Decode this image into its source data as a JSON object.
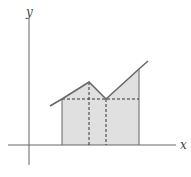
{
  "diagram": {
    "axes": {
      "x_label": "x",
      "y_label": "y"
    },
    "colors": {
      "axis": "#666666",
      "curve": "#666666",
      "fill": "#e0e0e0",
      "dashed": "#333333"
    },
    "curve_points": [
      [
        50,
        106
      ],
      [
        62,
        99
      ],
      [
        89,
        82
      ],
      [
        106,
        99
      ],
      [
        139,
        69
      ],
      [
        148,
        61
      ]
    ],
    "shaded_region": {
      "x_start": 62,
      "x_end": 139,
      "baseline_y": 145
    },
    "dashed_verticals": [
      89,
      106
    ],
    "dashed_horizontal_y": 99
  }
}
